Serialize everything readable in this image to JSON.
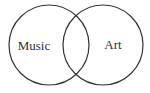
{
  "diagram": {
    "type": "venn",
    "sets": [
      {
        "label": "Music",
        "cx": 49,
        "cy": 45,
        "r": 40
      },
      {
        "label": "Art",
        "cx": 103,
        "cy": 45,
        "r": 40
      }
    ],
    "stroke_color": "#333333",
    "background": "#ffffff"
  }
}
